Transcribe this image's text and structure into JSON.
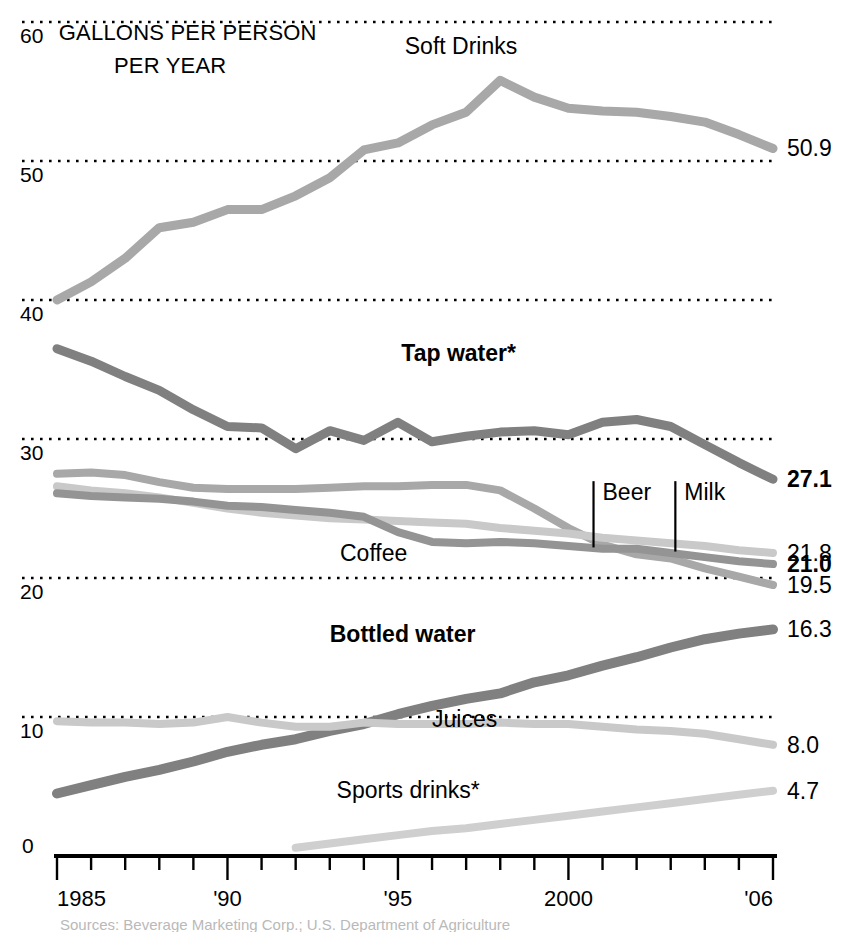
{
  "chart_data": {
    "type": "line",
    "title_line1": "GALLONS PER PERSON",
    "title_line2": "PER YEAR",
    "xlabel": "",
    "ylabel": "GALLONS PER PERSON PER YEAR",
    "xlim": [
      1985,
      2006
    ],
    "ylim": [
      0,
      60
    ],
    "grid": true,
    "gridlines": [
      0,
      10,
      20,
      30,
      40,
      50,
      60
    ],
    "ytick_labels": [
      "0",
      "10",
      "20",
      "30",
      "40",
      "50",
      "60"
    ],
    "x": [
      1985,
      1986,
      1987,
      1988,
      1989,
      1990,
      1991,
      1992,
      1993,
      1994,
      1995,
      1996,
      1997,
      1998,
      1999,
      2000,
      2001,
      2002,
      2003,
      2004,
      2005,
      2006
    ],
    "xtick_values": [
      1985,
      1986,
      1987,
      1988,
      1989,
      1990,
      1991,
      1992,
      1993,
      1994,
      1995,
      1996,
      1997,
      1998,
      1999,
      2000,
      2001,
      2002,
      2003,
      2004,
      2005,
      2006
    ],
    "xtick_labels": [
      {
        "value": 1985,
        "label": "1985"
      },
      {
        "value": 1990,
        "label": "'90"
      },
      {
        "value": 1995,
        "label": "'95"
      },
      {
        "value": 2000,
        "label": "2000"
      },
      {
        "value": 2006,
        "label": "'06"
      }
    ],
    "legend_position": "inline-annotations",
    "series": [
      {
        "name": "Soft Drinks",
        "label": "Soft Drinks",
        "bold": false,
        "color": "#a8a8a8",
        "width": 9,
        "end_value": "50.9",
        "end_value_bold": false,
        "label_x": 1995.2,
        "label_y": 57.7,
        "values": [
          40.0,
          41.3,
          43.0,
          45.2,
          45.6,
          46.5,
          46.5,
          47.5,
          48.8,
          50.8,
          51.3,
          52.6,
          53.5,
          55.8,
          54.6,
          53.8,
          53.6,
          53.5,
          53.2,
          52.8,
          51.9,
          50.9
        ]
      },
      {
        "name": "Tap water",
        "label": "Tap water*",
        "bold": true,
        "color": "#808080",
        "width": 9,
        "end_value": "27.1",
        "end_value_bold": true,
        "label_x": 1995.1,
        "label_y": 35.6,
        "values": [
          36.5,
          35.6,
          34.5,
          33.5,
          32.1,
          30.9,
          30.8,
          29.3,
          30.6,
          29.9,
          31.2,
          29.8,
          30.2,
          30.5,
          30.6,
          30.3,
          31.2,
          31.4,
          30.9,
          29.6,
          28.3,
          27.1
        ]
      },
      {
        "name": "Coffee",
        "label": "Coffee",
        "bold": false,
        "color": "#a8a8a8",
        "width": 8,
        "end_value": "19.5",
        "end_value_bold": false,
        "label_x": 1993.3,
        "label_y": 21.2,
        "values": [
          27.5,
          27.6,
          27.4,
          26.9,
          26.5,
          26.4,
          26.4,
          26.4,
          26.5,
          26.6,
          26.6,
          26.7,
          26.7,
          26.3,
          25.0,
          23.6,
          22.4,
          21.7,
          21.4,
          20.7,
          20.1,
          19.5
        ]
      },
      {
        "name": "Beer",
        "label": "Beer",
        "bold": false,
        "color": "#c9c9c9",
        "width": 8,
        "end_value": "21.8",
        "end_value_bold": false,
        "label_x": 2001.0,
        "label_y": 25.6,
        "leader_to_y": 22.2,
        "values": [
          26.6,
          26.3,
          26.1,
          25.8,
          25.4,
          25.0,
          24.7,
          24.5,
          24.3,
          24.2,
          24.1,
          24.0,
          23.9,
          23.6,
          23.4,
          23.2,
          22.9,
          22.7,
          22.5,
          22.3,
          22.0,
          21.8
        ]
      },
      {
        "name": "Milk",
        "label": "Milk",
        "bold": false,
        "color": "#949494",
        "width": 8,
        "end_value": "21.0",
        "end_value_bold": true,
        "label_x": 2003.4,
        "label_y": 25.6,
        "leader_to_y": 21.9,
        "values": [
          26.1,
          25.9,
          25.8,
          25.7,
          25.5,
          25.2,
          25.1,
          24.9,
          24.7,
          24.4,
          23.3,
          22.6,
          22.5,
          22.6,
          22.5,
          22.3,
          22.1,
          22.1,
          21.8,
          21.5,
          21.2,
          21.0
        ]
      },
      {
        "name": "Bottled water",
        "label": "Bottled water",
        "bold": true,
        "color": "#808080",
        "width": 10,
        "end_value": "16.3",
        "end_value_bold": false,
        "label_x": 1993.0,
        "label_y": 15.4,
        "values": [
          4.5,
          5.1,
          5.7,
          6.2,
          6.8,
          7.5,
          8.0,
          8.4,
          9.0,
          9.5,
          10.2,
          10.8,
          11.3,
          11.7,
          12.5,
          13.0,
          13.7,
          14.3,
          15.0,
          15.6,
          16.0,
          16.3
        ]
      },
      {
        "name": "Juices",
        "label": "Juices",
        "bold": false,
        "color": "#c9c9c9",
        "width": 8,
        "end_value": "8.0",
        "end_value_bold": false,
        "label_x": 1996.0,
        "label_y": 9.3,
        "values": [
          9.7,
          9.6,
          9.6,
          9.5,
          9.6,
          10.0,
          9.6,
          9.3,
          9.3,
          9.6,
          9.5,
          9.5,
          9.5,
          9.6,
          9.5,
          9.5,
          9.3,
          9.1,
          9.0,
          8.8,
          8.4,
          8.0
        ]
      },
      {
        "name": "Sports drinks",
        "label": "Sports drinks*",
        "bold": false,
        "color": "#cfcfcf",
        "width": 8,
        "end_value": "4.7",
        "end_value_bold": false,
        "label_x": 1993.2,
        "label_y": 4.2,
        "start_year": 1992,
        "values": [
          null,
          null,
          null,
          null,
          null,
          null,
          null,
          0.6,
          0.9,
          1.2,
          1.5,
          1.8,
          2.0,
          2.3,
          2.6,
          2.9,
          3.2,
          3.5,
          3.8,
          4.1,
          4.4,
          4.7
        ]
      }
    ],
    "annotations": [
      {
        "text": "GALLONS PER PERSON",
        "x": 1985.2,
        "y": 59.0
      },
      {
        "text": "PER YEAR",
        "x": 1986.2,
        "y": 56.6
      }
    ]
  },
  "caption": {
    "text": "Sources: Beverage Marketing Corp.; U.S. Department of Agriculture"
  }
}
